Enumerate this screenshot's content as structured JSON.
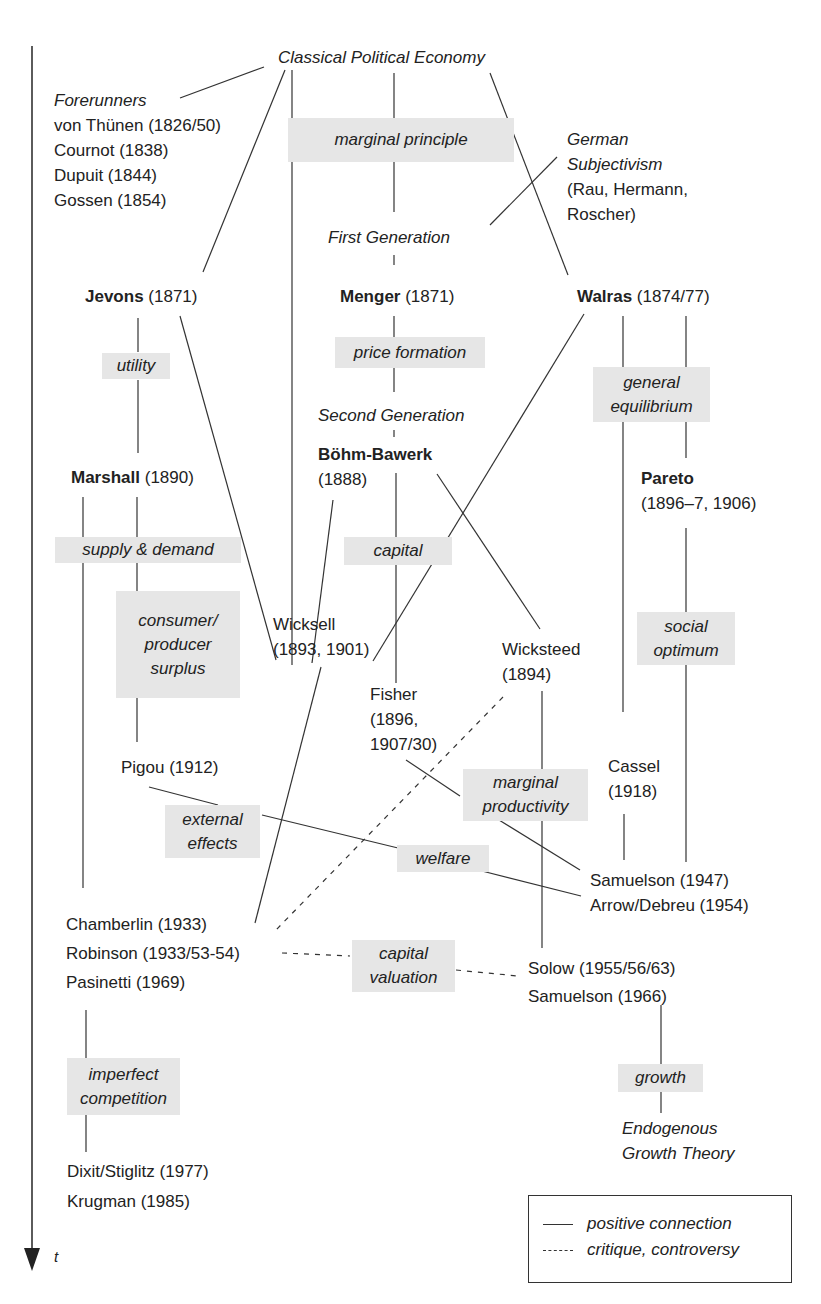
{
  "diagram": {
    "root": "Classical Political Economy",
    "forerunners": {
      "heading": "Forerunners",
      "items": [
        "von Thünen (1826/50)",
        "Cournot (1838)",
        "Dupuit (1844)",
        "Gossen (1854)"
      ]
    },
    "german_subjectivism": [
      "German",
      "Subjectivism",
      "(Rau, Hermann,",
      "Roscher)"
    ],
    "generations": {
      "first": "First Generation",
      "second": "Second Generation"
    },
    "economists": {
      "jevons": {
        "name": "Jevons",
        "year": "(1871)"
      },
      "menger": {
        "name": "Menger",
        "year": "(1871)"
      },
      "walras": {
        "name": "Walras",
        "year": "(1874/77)"
      },
      "marshall": {
        "name": "Marshall",
        "year": "(1890)"
      },
      "bohm_bawerk": {
        "name": "Böhm-Bawerk",
        "year": "(1888)"
      },
      "pareto": {
        "name": "Pareto",
        "year": "(1896–7, 1906)"
      },
      "wicksell": {
        "name": "Wicksell",
        "year": "(1893, 1901)"
      },
      "wicksteed": {
        "name": "Wicksteed",
        "year": "(1894)"
      },
      "fisher": {
        "name": "Fisher",
        "year1": "(1896,",
        "year2": "1907/30)"
      },
      "cassel": {
        "name": "Cassel",
        "year": "(1918)"
      },
      "pigou": "Pigou (1912)",
      "samuelson_1947": "Samuelson (1947)",
      "arrow_debreu": "Arrow/Debreu (1954)",
      "chamberlin": "Chamberlin (1933)",
      "robinson": "Robinson (1933/53-54)",
      "pasinetti": "Pasinetti (1969)",
      "solow": "Solow (1955/56/63)",
      "samuelson_1966": "Samuelson (1966)",
      "dixit_stiglitz": "Dixit/Stiglitz (1977)",
      "krugman": "Krugman (1985)",
      "endogenous": [
        "Endogenous",
        "Growth Theory"
      ]
    },
    "topics": {
      "marginal_principle": [
        "marginal principle"
      ],
      "utility": [
        "utility"
      ],
      "price_formation": [
        "price formation"
      ],
      "general_equilibrium": [
        "general",
        "equilibrium"
      ],
      "supply_demand": [
        "supply & demand"
      ],
      "capital": [
        "capital"
      ],
      "consumer_surplus": [
        "consumer/",
        "producer",
        "surplus"
      ],
      "social_optimum": [
        "social",
        "optimum"
      ],
      "marginal_productivity": [
        "marginal",
        "productivity"
      ],
      "external_effects": [
        "external",
        "effects"
      ],
      "welfare": [
        "welfare"
      ],
      "capital_valuation": [
        "capital",
        "valuation"
      ],
      "imperfect_competition": [
        "imperfect",
        "competition"
      ],
      "growth": [
        "growth"
      ]
    },
    "axis": {
      "label": "t"
    },
    "legend": {
      "positive": "positive connection",
      "critique": "critique, controversy"
    },
    "colors": {
      "topic_bg": "#e6e6e6",
      "line": "#333333"
    }
  }
}
